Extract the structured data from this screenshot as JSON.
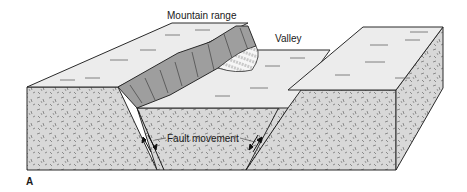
{
  "figure": {
    "panel_label": "A",
    "labels": {
      "mountain_range": "Mountain range",
      "valley": "Valley",
      "fault_movement": "Fault movement"
    },
    "colors": {
      "surface": "#ececec",
      "rock_face": "#d6d6d6",
      "cliff": "#9e9e9e",
      "outline": "#2a2a2a",
      "fan": "#f4f4f4"
    }
  }
}
